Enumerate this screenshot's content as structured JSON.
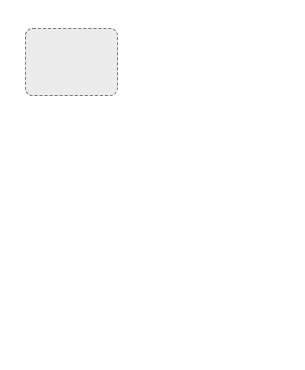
{
  "groups": {
    "basic_simulator": {
      "title": "basic simulator"
    },
    "traffic_environment": {
      "title": "traffic environment"
    },
    "gids": {
      "title": "GIDS"
    }
  },
  "nodes": {
    "carbody": "carbody",
    "carmodel": "carmodel",
    "graphical_environment_1": "graphical",
    "graphical_environment_2": "environment",
    "traverser": "traverser",
    "intelligence": "intelligence",
    "sensors": "sensors",
    "network": "network",
    "carbody_interface_1": "carbody",
    "carbody_interface_2": "interface",
    "sensory_interface_1": "sensory",
    "sensory_interface_2": "interface",
    "gids_subsystems_1": "GIDS",
    "gids_subsystems_2": "subsystems"
  },
  "colors": {
    "group_fill": "#ececec",
    "stroke": "#444444",
    "node_fill": "#ffffff"
  }
}
